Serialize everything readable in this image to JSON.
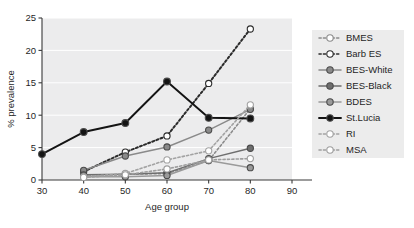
{
  "chart_data": {
    "type": "line",
    "title": "",
    "xlabel": "Age group",
    "ylabel": "% prevalence",
    "xlim": [
      30,
      90
    ],
    "ylim": [
      0,
      25
    ],
    "xticks": [
      30,
      40,
      50,
      60,
      70,
      80,
      90
    ],
    "yticks": [
      0,
      5,
      10,
      15,
      20,
      25
    ],
    "grid": true,
    "legend_position": "right",
    "x": [
      30,
      40,
      50,
      60,
      70,
      80
    ],
    "series": [
      {
        "name": "BMES",
        "marker": "open-circle",
        "line": "dotted",
        "color": "#8c8c8c",
        "x": [
          40,
          50,
          60,
          70,
          80
        ],
        "values": [
          0.6,
          0.9,
          1.0,
          3.0,
          11.0
        ]
      },
      {
        "name": "Barb ES",
        "marker": "open-circle",
        "line": "dotted",
        "color": "#2b2b2b",
        "x": [
          40,
          50,
          60,
          70,
          80
        ],
        "values": [
          1.3,
          4.3,
          6.8,
          14.9,
          23.3
        ]
      },
      {
        "name": "BES-White",
        "marker": "filled-circle",
        "line": "solid",
        "color": "#8a8a8a",
        "x": [
          40,
          50,
          60,
          70,
          80
        ],
        "values": [
          1.5,
          3.7,
          5.1,
          7.7,
          10.9
        ]
      },
      {
        "name": "BES-Black",
        "marker": "filled-circle",
        "line": "solid",
        "color": "#6e6e6e",
        "x": [
          40,
          50,
          60,
          70,
          80
        ],
        "values": [
          0.8,
          0.9,
          1.1,
          3.3,
          4.9
        ]
      },
      {
        "name": "BDES",
        "marker": "filled-circle",
        "line": "solid",
        "color": "#9a9a9a",
        "x": [
          40,
          50,
          60,
          70,
          80
        ],
        "values": [
          0.5,
          0.5,
          0.7,
          3.0,
          1.9
        ]
      },
      {
        "name": "St.Lucia",
        "marker": "filled-circle",
        "line": "solid",
        "color": "#141414",
        "x": [
          30,
          40,
          50,
          60,
          70,
          80
        ],
        "values": [
          4.0,
          7.4,
          8.8,
          15.2,
          9.6,
          9.5
        ]
      },
      {
        "name": "RI",
        "marker": "open-circle",
        "line": "dotted",
        "color": "#a2a2a2",
        "x": [
          40,
          50,
          60,
          70,
          80
        ],
        "values": [
          0.5,
          1.0,
          3.1,
          4.5,
          11.6
        ]
      },
      {
        "name": "MSA",
        "marker": "open-circle",
        "line": "dotted",
        "color": "#9e9e9e",
        "x": [
          40,
          50,
          60,
          70,
          80
        ],
        "values": [
          0.4,
          0.8,
          1.7,
          3.1,
          3.3
        ]
      }
    ]
  },
  "legend": {
    "items": [
      {
        "label": "BMES"
      },
      {
        "label": "Barb ES"
      },
      {
        "label": "BES-White"
      },
      {
        "label": "BES-Black"
      },
      {
        "label": "BDES"
      },
      {
        "label": "St.Lucia"
      },
      {
        "label": "RI"
      },
      {
        "label": "MSA"
      }
    ]
  },
  "axes": {
    "x_title": "Age group",
    "y_title": "% prevalence",
    "x_tick_labels": [
      "30",
      "40",
      "50",
      "60",
      "70",
      "80",
      "90"
    ],
    "y_tick_labels": [
      "0",
      "5",
      "10",
      "15",
      "20",
      "25"
    ]
  }
}
